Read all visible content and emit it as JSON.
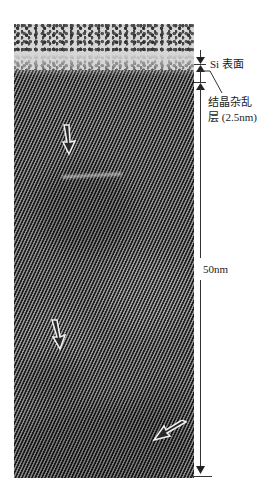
{
  "figure": {
    "type": "TEM lattice image of Si surface region",
    "annotations": {
      "surface_label": "Si 表面",
      "disorder_label_line1": "结晶杂乱",
      "disorder_label_line2": "层 (2.5nm)",
      "depth_label": "50nm"
    },
    "arrows_in_image": [
      {
        "name": "arrow-defect-upper",
        "direction": "down"
      },
      {
        "name": "arrow-defect-middle",
        "direction": "down"
      },
      {
        "name": "arrow-defect-lower",
        "direction": "down-left"
      }
    ],
    "colors": {
      "background": "#ffffff",
      "annotation": "#333333",
      "arrow_outline": "#ffffff"
    }
  }
}
